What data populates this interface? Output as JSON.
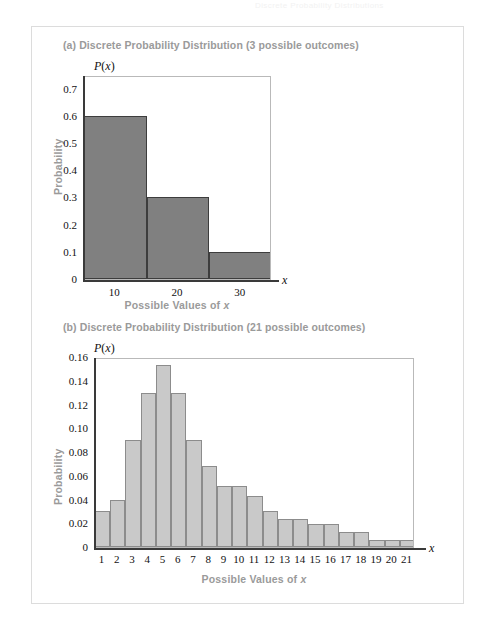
{
  "ghost_header_text": "Discrete Probability Distributions",
  "figure": {
    "panel_name": "probability-distributions-figure"
  },
  "chart_data": [
    {
      "id": "chart-a",
      "type": "bar",
      "title": "(a) Discrete Probability Distribution (3 possible outcomes)",
      "xlabel": "Possible Values of x",
      "ylabel": "Probability",
      "axis_var_x": "x",
      "axis_var_y": "P(x)",
      "categories": [
        10,
        20,
        30
      ],
      "values": [
        0.6,
        0.3,
        0.1
      ],
      "xtick_labels": [
        "10",
        "20",
        "30"
      ],
      "ytick_labels": [
        "0",
        "0.1",
        "0.2",
        "0.3",
        "0.4",
        "0.5",
        "0.6",
        "0.7"
      ],
      "ytick_values": [
        0,
        0.1,
        0.2,
        0.3,
        0.4,
        0.5,
        0.6,
        0.7
      ],
      "ylim": [
        0,
        0.75
      ],
      "xlim": [
        5,
        35
      ],
      "bar_width": 10,
      "bar_color": "#808080",
      "bar_border_color": "#3d3d3d",
      "grid": false,
      "legend": "none"
    },
    {
      "id": "chart-b",
      "type": "bar",
      "title": "(b) Discrete Probability Distribution (21 possible outcomes)",
      "xlabel": "Possible Values of x",
      "ylabel": "Probability",
      "axis_var_x": "x",
      "axis_var_y": "P(x)",
      "categories": [
        1,
        2,
        3,
        4,
        5,
        6,
        7,
        8,
        9,
        10,
        11,
        12,
        13,
        14,
        15,
        16,
        17,
        18,
        19,
        20,
        21
      ],
      "values": [
        0.03,
        0.04,
        0.09,
        0.13,
        0.153,
        0.13,
        0.09,
        0.068,
        0.051,
        0.051,
        0.043,
        0.03,
        0.024,
        0.024,
        0.019,
        0.019,
        0.013,
        0.013,
        0.006,
        0.006,
        0.006
      ],
      "xtick_labels": [
        "1",
        "2",
        "3",
        "4",
        "5",
        "6",
        "7",
        "8",
        "9",
        "10",
        "11",
        "12",
        "13",
        "14",
        "15",
        "16",
        "17",
        "18",
        "19",
        "20",
        "21"
      ],
      "ytick_labels": [
        "0",
        "0.02",
        "0.04",
        "0.06",
        "0.08",
        "0.10",
        "0.12",
        "0.14",
        "0.16"
      ],
      "ytick_values": [
        0,
        0.02,
        0.04,
        0.06,
        0.08,
        0.1,
        0.12,
        0.14,
        0.16
      ],
      "ylim": [
        0,
        0.16
      ],
      "grid": false,
      "bar_color": "#c9c9c9",
      "bar_border_color": "#8c8c8c",
      "legend": "none"
    }
  ]
}
